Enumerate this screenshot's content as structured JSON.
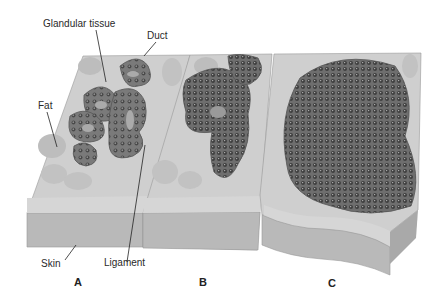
{
  "diagram": {
    "type": "anatomical cross-section",
    "labels": {
      "glandular_tissue": "Glandular tissue",
      "duct": "Duct",
      "fat": "Fat",
      "skin": "Skin",
      "ligament": "Ligament"
    },
    "panels": [
      {
        "id": "A",
        "label": "A"
      },
      {
        "id": "B",
        "label": "B"
      },
      {
        "id": "C",
        "label": "C"
      }
    ],
    "colors": {
      "skin_block": "#b9b9b9",
      "skin_top": "#d6d6d6",
      "stroma": "#cfcfcf",
      "fat_lobule": "#bdbdbd",
      "gland": "#777777",
      "gland_lumen": "#aaaaaa",
      "cell_dot": "#4a4a4a"
    }
  }
}
